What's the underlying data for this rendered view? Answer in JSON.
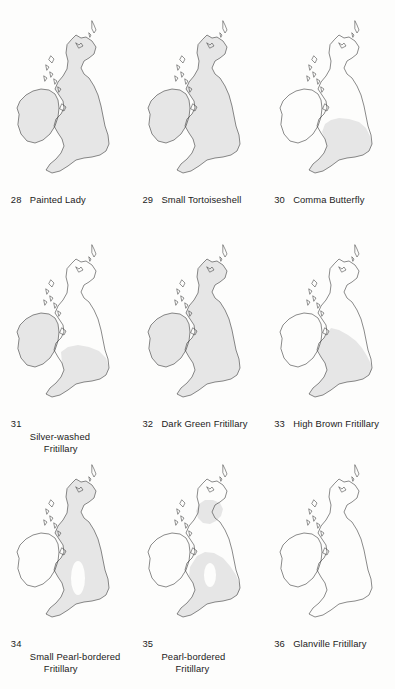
{
  "figure": {
    "region": "British Isles",
    "shading_color": "#e6e6e6",
    "outline_color": "#2a2a2a",
    "background_color": "#fdfdfc",
    "shading_meaning": "shaded area = recorded distribution range"
  },
  "maps": [
    {
      "number": "28",
      "name": "Painted Lady",
      "name_line1": "Painted Lady",
      "name_line2": "",
      "distribution": "all of Great Britain and Ireland shaded",
      "shaded": [
        "ireland",
        "scotland",
        "england",
        "wales"
      ]
    },
    {
      "number": "29",
      "name": "Small Tortoiseshell",
      "name_line1": "Small Tortoiseshell",
      "name_line2": "",
      "distribution": "all of Great Britain and Ireland shaded",
      "shaded": [
        "ireland",
        "scotland",
        "england",
        "wales"
      ]
    },
    {
      "number": "30",
      "name": "Comma Butterfly",
      "name_line1": "Comma Butterfly",
      "name_line2": "",
      "distribution": "southern England and Wales only",
      "shaded": [
        "south-england",
        "wales"
      ]
    },
    {
      "number": "31",
      "name": "Silver-washed Fritillary",
      "name_line1": "Silver-washed",
      "name_line2": "Fritillary",
      "distribution": "Ireland plus southern England and Wales",
      "shaded": [
        "ireland",
        "south-england",
        "wales"
      ]
    },
    {
      "number": "32",
      "name": "Dark Green Fritillary",
      "name_line1": "Dark Green Fritillary",
      "name_line2": "",
      "distribution": "all of Great Britain and Ireland shaded",
      "shaded": [
        "ireland",
        "scotland",
        "england",
        "wales"
      ]
    },
    {
      "number": "33",
      "name": "High Brown Fritillary",
      "name_line1": "High Brown Fritillary",
      "name_line2": "",
      "distribution": "England and Wales only",
      "shaded": [
        "england",
        "wales"
      ]
    },
    {
      "number": "34",
      "name": "Small Pearl-bordered Fritillary",
      "name_line1": "Small Pearl-bordered",
      "name_line2": "Fritillary",
      "distribution": "Great Britain shaded with a gap in the English Midlands; Ireland unshaded",
      "shaded": [
        "scotland",
        "england",
        "wales"
      ]
    },
    {
      "number": "35",
      "name": "Pearl-bordered Fritillary",
      "name_line1": "Pearl-bordered",
      "name_line2": "Fritillary",
      "distribution": "central Scotland and much of England and Wales, patchy",
      "shaded": [
        "central-scotland",
        "england",
        "wales"
      ]
    },
    {
      "number": "36",
      "name": "Glanville Fritillary",
      "name_line1": "Glanville Fritillary",
      "name_line2": "",
      "distribution": "no shading shown",
      "shaded": []
    }
  ]
}
